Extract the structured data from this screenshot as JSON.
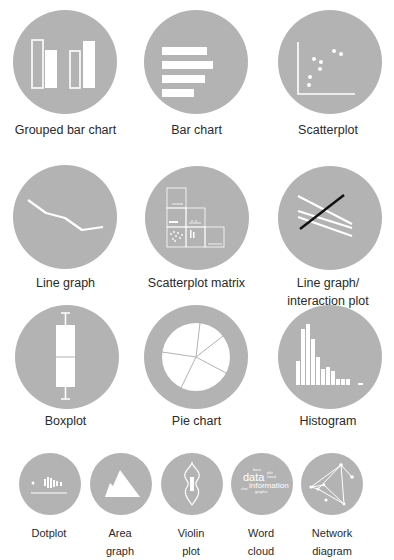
{
  "colors": {
    "circle": "#b3b3b3",
    "icon": "#ffffff",
    "accent_line": "#111111",
    "text": "#2a2a2a"
  },
  "tiles": [
    {
      "label": "Grouped bar chart",
      "icon": "grouped-bar-chart-icon"
    },
    {
      "label": "Bar chart",
      "icon": "bar-chart-icon"
    },
    {
      "label": "Scatterplot",
      "icon": "scatterplot-icon"
    },
    {
      "label": "Line graph",
      "icon": "line-graph-icon"
    },
    {
      "label": "Scatterplot matrix",
      "icon": "scatterplot-matrix-icon"
    },
    {
      "label_line1": "Line graph/",
      "label_line2": "interaction plot",
      "icon": "interaction-plot-icon"
    },
    {
      "label": "Boxplot",
      "icon": "boxplot-icon"
    },
    {
      "label": "Pie chart",
      "icon": "pie-chart-icon"
    },
    {
      "label": "Histogram",
      "icon": "histogram-icon"
    },
    {
      "label_line1": "Dotplot",
      "label_line2": "",
      "icon": "dotplot-icon"
    },
    {
      "label_line1": "Area",
      "label_line2": "graph",
      "icon": "area-graph-icon"
    },
    {
      "label_line1": "Violin",
      "label_line2": "plot",
      "icon": "violin-plot-icon"
    },
    {
      "label_line1": "Word",
      "label_line2": "cloud",
      "icon": "word-cloud-icon"
    },
    {
      "label_line1": "Network",
      "label_line2": "diagram",
      "icon": "network-diagram-icon"
    }
  ],
  "word_cloud_words": [
    "bars",
    "data",
    "information",
    "graphs",
    "plot",
    "visual",
    "chart"
  ]
}
